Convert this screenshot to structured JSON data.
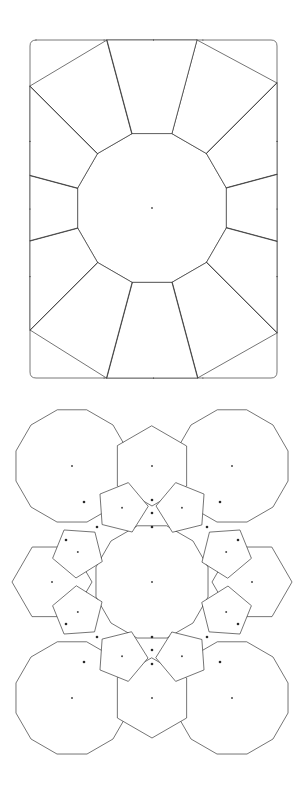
{
  "document": {
    "title": "Geometric tiling figures",
    "background_color": "#ffffff",
    "stroke_color": "#3a3a3a",
    "dot_color": "#2a2a2a",
    "width": 308,
    "height": 788
  },
  "figures": [
    {
      "id": "figure-top",
      "name": "framed-rosette-tiling",
      "caption": "",
      "frame": {
        "type": "rectangle",
        "x": 30,
        "y": 40,
        "width": 247,
        "height": 338,
        "corner_style": "slightly-rounded"
      },
      "center": {
        "x": 152,
        "y": 208
      },
      "central_polygon": {
        "sides": 12,
        "radius": 77,
        "rotation_deg": 15
      },
      "ring_polygons": [
        {
          "sides": 5,
          "count": 8,
          "label": "pentagon-ring"
        },
        {
          "sides": 4,
          "count": 4,
          "label": "corner-square"
        }
      ],
      "markers": {
        "center_dots": 1,
        "edge_ticks": true
      }
    },
    {
      "id": "figure-bottom",
      "name": "dodecagon-hexagon-pentagon-tiling",
      "caption": "",
      "center": {
        "x": 152,
        "y": 582
      },
      "bounds": {
        "x_min": 22,
        "x_max": 283,
        "y_min": 408,
        "y_max": 754
      },
      "central_polygon": {
        "sides": 12,
        "radius": 58,
        "rotation_deg": 15
      },
      "corner_polygons": {
        "sides": 12,
        "count": 4,
        "radius": 58,
        "centers": [
          {
            "x": 72,
            "y": 466
          },
          {
            "x": 232,
            "y": 466
          },
          {
            "x": 72,
            "y": 698
          },
          {
            "x": 232,
            "y": 698
          }
        ]
      },
      "edge_polygons": {
        "sides": 6,
        "count": 4,
        "labels": [
          "hexagon-top",
          "hexagon-bottom",
          "hexagon-left",
          "hexagon-right"
        ]
      },
      "ring_polygons": {
        "sides": 5,
        "count": 8,
        "label": "pentagon-ring"
      },
      "markers": {
        "center_dots": 17,
        "vertex_dots": true
      }
    }
  ],
  "legend": {
    "shape_names": {
      "dodecagon": "12-sided polygon",
      "hexagon": "6-sided polygon",
      "pentagon": "5-sided polygon",
      "square": "4-sided polygon"
    }
  }
}
